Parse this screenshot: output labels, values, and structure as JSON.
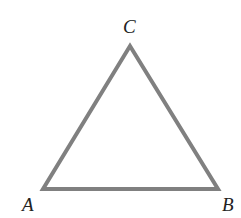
{
  "diagram": {
    "type": "triangle",
    "stroke_color": "#808080",
    "stroke_width": 4,
    "vertices": {
      "A": {
        "label": "A",
        "x": 43,
        "y": 189
      },
      "B": {
        "label": "B",
        "x": 218,
        "y": 189
      },
      "C": {
        "label": "C",
        "x": 130,
        "y": 46
      }
    },
    "labels": {
      "A": "A",
      "B": "B",
      "C": "C"
    }
  }
}
